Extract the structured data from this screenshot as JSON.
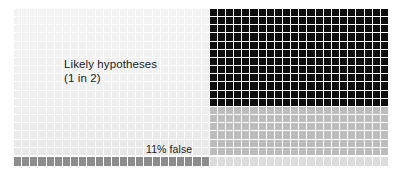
{
  "figure": {
    "type": "waffle-grid-infographic",
    "background": "#ffffff",
    "width": 401,
    "height": 173
  },
  "labels": {
    "main_line1": "Likely hypotheses",
    "main_line2": "(1 in 2)",
    "false_rate": "11% false"
  },
  "chart_data": {
    "type": "heatmap",
    "title": "Likely hypotheses (1 in 2)",
    "grid": {
      "columns": 46,
      "rows": 18,
      "cell_gap": 1
    },
    "split": {
      "column_boundary": 24,
      "row_boundary": 12
    },
    "quadrants": [
      {
        "name": "true-not-significant",
        "color": "#f2f2f2",
        "cols": [
          0,
          24
        ],
        "rows": [
          0,
          12
        ]
      },
      {
        "name": "true-significant",
        "color": "#0d0d0d",
        "cols": [
          24,
          46
        ],
        "rows": [
          0,
          12
        ]
      },
      {
        "name": "false-not-significant",
        "color": "#ececec",
        "cols": [
          0,
          24
        ],
        "rows": [
          12,
          18
        ]
      },
      {
        "name": "false-significant",
        "color": "#bcbcbc",
        "cols": [
          24,
          46
        ],
        "rows": [
          12,
          18
        ]
      }
    ],
    "bottom_strip": {
      "name": "false-positives-row",
      "filled_color": "#8c8c8c",
      "empty_color": "#dcdcdc",
      "filled_columns": 24,
      "total_columns": 46,
      "annotation": "11% false"
    },
    "legend_position": "none",
    "grid_on": true,
    "values": {
      "prior_odds": "1 in 2",
      "false_rate_percent": 11
    }
  },
  "colors": {
    "dark": "#0d0d0d",
    "light_left_top": "#f2f2f2",
    "light_left_bottom": "#ececec",
    "mid_gray": "#bcbcbc",
    "strip_filled": "#8c8c8c",
    "strip_empty": "#dcdcdc",
    "text": "#1a1a1a"
  }
}
